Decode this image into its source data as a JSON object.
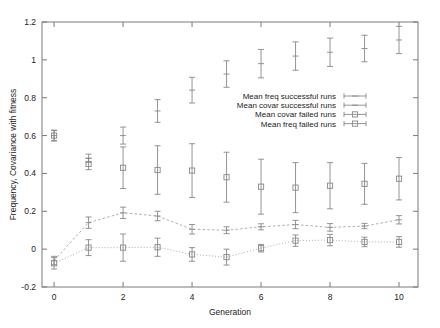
{
  "chart_data": {
    "type": "scatter",
    "title": "",
    "xlabel": "Generation",
    "ylabel": "Frequency, Covariance with fitness",
    "xlim": [
      -0.35,
      10.55
    ],
    "ylim": [
      -0.2,
      1.2
    ],
    "xticks": [
      0,
      2,
      4,
      6,
      8,
      10
    ],
    "xticklabels": [
      "0",
      "2",
      "4",
      "6",
      "8",
      "10"
    ],
    "yticks": [
      -0.2,
      0,
      0.2,
      0.4,
      0.6,
      0.8,
      1,
      1.2
    ],
    "yticklabels": [
      "-0.2",
      "0",
      "0.2",
      "0.4",
      "0.6",
      "0.8",
      "1",
      "1.2"
    ],
    "grid": false,
    "legend_position": "center-right",
    "x": [
      0,
      1,
      2,
      3,
      4,
      5,
      6,
      7,
      8,
      9,
      10
    ],
    "series": [
      {
        "name": "Mean  freq successful runs",
        "marker": "errorbar",
        "connected": false,
        "values": [
          0.6,
          0.48,
          0.6,
          0.73,
          0.84,
          0.925,
          0.98,
          1.02,
          1.04,
          1.06,
          1.105
        ],
        "err_low": [
          0.028,
          0.022,
          0.045,
          0.06,
          0.068,
          0.07,
          0.075,
          0.075,
          0.075,
          0.07,
          0.072
        ],
        "err_high": [
          0.028,
          0.022,
          0.045,
          0.06,
          0.068,
          0.07,
          0.075,
          0.075,
          0.075,
          0.07,
          0.072
        ]
      },
      {
        "name": "Mean covar successful runs",
        "marker": "errorbar",
        "connected": true,
        "linestyle": "dashed",
        "values": [
          -0.06,
          0.14,
          0.192,
          0.175,
          0.105,
          0.1,
          0.118,
          0.13,
          0.115,
          0.122,
          0.155
        ],
        "err_low": [
          0.022,
          0.03,
          0.03,
          0.025,
          0.025,
          0.018,
          0.016,
          0.022,
          0.02,
          0.014,
          0.022
        ],
        "err_high": [
          0.022,
          0.03,
          0.03,
          0.025,
          0.025,
          0.018,
          0.016,
          0.022,
          0.02,
          0.014,
          0.022
        ]
      },
      {
        "name": "Mean covar    failed runs",
        "marker": "square",
        "connected": true,
        "linestyle": "dotted",
        "values": [
          -0.075,
          0.008,
          0.008,
          0.01,
          -0.028,
          -0.042,
          0.005,
          0.045,
          0.048,
          0.038,
          0.038
        ],
        "err_low": [
          0.03,
          0.042,
          0.072,
          0.048,
          0.036,
          0.042,
          0.02,
          0.03,
          0.03,
          0.025,
          0.028
        ],
        "err_high": [
          0.03,
          0.042,
          0.072,
          0.048,
          0.036,
          0.042,
          0.02,
          0.03,
          0.03,
          0.025,
          0.028
        ]
      },
      {
        "name": "Mean freq     failed runs",
        "marker": "square",
        "connected": false,
        "values": [
          0.6,
          0.45,
          0.43,
          0.418,
          0.415,
          0.38,
          0.33,
          0.325,
          0.335,
          0.345,
          0.372
        ],
        "err_low": [
          0.028,
          0.03,
          0.11,
          0.128,
          0.142,
          0.132,
          0.145,
          0.132,
          0.122,
          0.108,
          0.112
        ],
        "err_high": [
          0.028,
          0.03,
          0.11,
          0.128,
          0.142,
          0.132,
          0.145,
          0.132,
          0.122,
          0.108,
          0.112
        ]
      }
    ],
    "legend": [
      {
        "label": "Mean  freq successful runs",
        "marker": "errorbar"
      },
      {
        "label": "Mean covar successful runs",
        "marker": "errorbar"
      },
      {
        "label": "Mean covar    failed runs",
        "marker": "square"
      },
      {
        "label": "Mean freq     failed runs",
        "marker": "square"
      }
    ]
  }
}
